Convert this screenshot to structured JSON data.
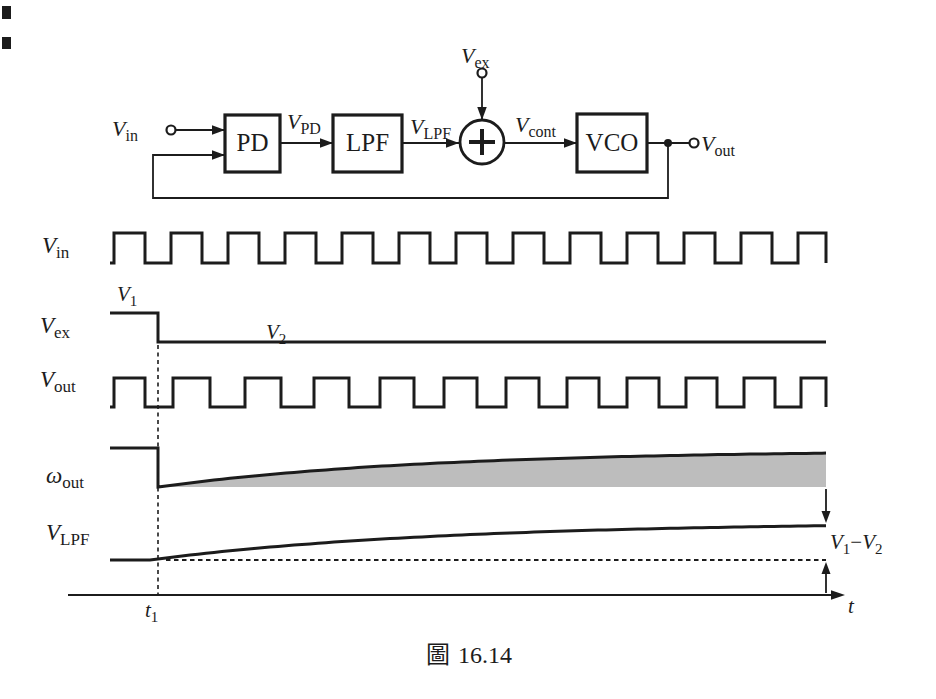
{
  "figure": {
    "caption_prefix": "圖",
    "caption_number": "16.14"
  },
  "colors": {
    "line": "#1c1c1c",
    "shade": "#bdbdbd",
    "background": "#ffffff"
  },
  "diagram": {
    "blocks": [
      {
        "label": "PD"
      },
      {
        "label": "LPF"
      },
      {
        "label": "VCO"
      }
    ],
    "summer_symbol": "+",
    "signals": {
      "v_in": {
        "base": "V",
        "sub": "in"
      },
      "v_pd": {
        "base": "V",
        "sub": "PD"
      },
      "v_lpf": {
        "base": "V",
        "sub": "LPF"
      },
      "v_ex": {
        "base": "V",
        "sub": "ex"
      },
      "v_cont": {
        "base": "V",
        "sub": "cont"
      },
      "v_out": {
        "base": "V",
        "sub": "out"
      }
    }
  },
  "waveforms": {
    "rows": [
      {
        "base": "V",
        "sub": "in"
      },
      {
        "base": "V",
        "sub": "ex"
      },
      {
        "base": "V",
        "sub": "out"
      },
      {
        "base": "ω",
        "sub": "out"
      },
      {
        "base": "V",
        "sub": "LPF"
      }
    ],
    "annotations": {
      "v1": {
        "base": "V",
        "sub": "1"
      },
      "v2": {
        "base": "V",
        "sub": "2"
      },
      "diff": {
        "left_base": "V",
        "left_sub": "1",
        "minus": "−",
        "right_base": "V",
        "right_sub": "2"
      },
      "t1": {
        "base": "t",
        "sub": "1"
      },
      "t_axis": "t"
    }
  }
}
